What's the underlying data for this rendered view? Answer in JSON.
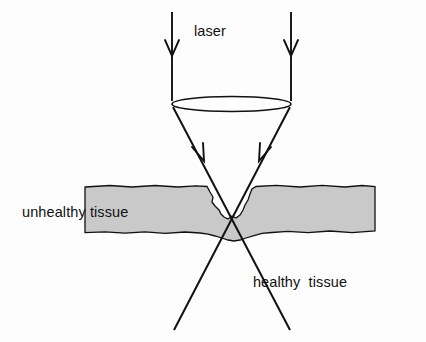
{
  "figure": {
    "background_color": "#fdfdfd",
    "ink_color": "#111111",
    "tissue_fill_color": "#c9c9c9",
    "width": 426,
    "height": 342
  },
  "labels": {
    "laser": "laser",
    "unhealthy_tissue": "unhealthy tissue",
    "healthy_tissue": "healthy  tissue"
  },
  "elements": {
    "beam_left_name": "incoming-beam-left",
    "beam_right_name": "incoming-beam-right",
    "lens_name": "focusing-lens",
    "converging_left_name": "converging-ray-left",
    "converging_right_name": "converging-ray-right",
    "focus_point": "focal point at tissue crater"
  },
  "geometry": {
    "beam_left_x": 172,
    "beam_right_x": 291,
    "beam_top_y": 12,
    "lens_center_y": 104,
    "lens_rx": 59,
    "lens_ry": 7,
    "focus_x": 232,
    "focus_y": 212,
    "ray_bottom_y": 330,
    "tissue_left_x": 85,
    "tissue_right_x": 375,
    "tissue_top_y": 186,
    "tissue_bottom_y": 232
  }
}
